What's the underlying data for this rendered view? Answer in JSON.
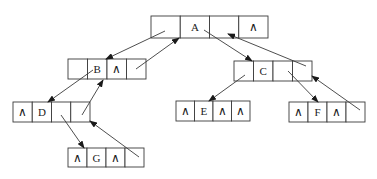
{
  "diagram": {
    "type": "binary tree linked storage (four-field nodes with parent pointer)",
    "null_symbol": "∧",
    "colors": {
      "line": "#3a3a3a",
      "text": "#222222",
      "background": "#ffffff"
    },
    "nodes": [
      {
        "id": "A",
        "x": 151,
        "y": 16,
        "w": 117,
        "h": 22,
        "cells": [
          "",
          "A",
          "",
          "∧"
        ]
      },
      {
        "id": "B",
        "x": 68,
        "y": 59,
        "w": 78,
        "h": 20,
        "cells": [
          "",
          "B",
          "∧",
          ""
        ]
      },
      {
        "id": "C",
        "x": 234,
        "y": 61,
        "w": 78,
        "h": 20,
        "cells": [
          "",
          "C",
          "",
          ""
        ]
      },
      {
        "id": "D",
        "x": 13,
        "y": 102,
        "w": 77,
        "h": 20,
        "cells": [
          "∧",
          "D",
          "",
          ""
        ]
      },
      {
        "id": "E",
        "x": 176,
        "y": 101,
        "w": 74,
        "h": 20,
        "cells": [
          "∧",
          "E",
          "∧",
          "∧"
        ]
      },
      {
        "id": "F",
        "x": 289,
        "y": 102,
        "w": 76,
        "h": 20,
        "cells": [
          "∧",
          "F",
          "∧",
          ""
        ]
      },
      {
        "id": "G",
        "x": 68,
        "y": 148,
        "w": 76,
        "h": 19,
        "cells": [
          "∧",
          "G",
          "∧",
          ""
        ]
      }
    ],
    "edges": [
      {
        "from": "A.left",
        "to": "B",
        "x1": 165,
        "y1": 31,
        "x2": 106,
        "y2": 59
      },
      {
        "from": "B.parent",
        "to": "A",
        "x1": 136,
        "y1": 69,
        "x2": 179,
        "y2": 38
      },
      {
        "from": "A.right",
        "to": "C",
        "x1": 204,
        "y1": 30,
        "x2": 252,
        "y2": 61
      },
      {
        "from": "C.parent",
        "to": "A",
        "x1": 306,
        "y1": 66,
        "x2": 228,
        "y2": 34
      },
      {
        "from": "B.left",
        "to": "D",
        "x1": 93,
        "y1": 70,
        "x2": 48,
        "y2": 102
      },
      {
        "from": "D.parent",
        "to": "B",
        "x1": 82,
        "y1": 115,
        "x2": 103,
        "y2": 80
      },
      {
        "from": "D.right",
        "to": "G",
        "x1": 61,
        "y1": 115,
        "x2": 84,
        "y2": 148
      },
      {
        "from": "G.parent",
        "to": "D",
        "x1": 139,
        "y1": 157,
        "x2": 90,
        "y2": 121
      },
      {
        "from": "C.left",
        "to": "E",
        "x1": 245,
        "y1": 75,
        "x2": 209,
        "y2": 101
      },
      {
        "from": "C.right",
        "to": "F",
        "x1": 288,
        "y1": 71,
        "x2": 318,
        "y2": 102
      },
      {
        "from": "F.parent",
        "to": "C",
        "x1": 360,
        "y1": 110,
        "x2": 312,
        "y2": 76
      },
      {
        "from": "E.parent",
        "to": "C",
        "x1": 0,
        "y1": 0,
        "x2": 0,
        "y2": 0,
        "hidden": true
      }
    ]
  }
}
